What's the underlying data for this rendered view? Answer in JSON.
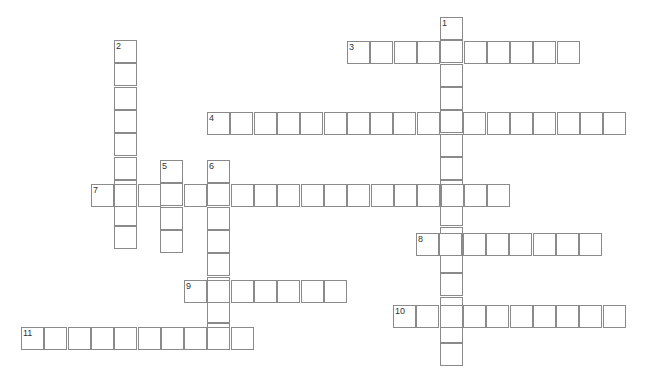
{
  "puzzle": {
    "type": "crossword",
    "cell_size": 23.3,
    "words": [
      {
        "number": "1",
        "direction": "down",
        "x": 440,
        "y": 17,
        "length": 15
      },
      {
        "number": "2",
        "direction": "down",
        "x": 114,
        "y": 40,
        "length": 9
      },
      {
        "number": "3",
        "direction": "across",
        "x": 347,
        "y": 41,
        "length": 10
      },
      {
        "number": "4",
        "direction": "across",
        "x": 207,
        "y": 112,
        "length": 18
      },
      {
        "number": "5",
        "direction": "down",
        "x": 160,
        "y": 160,
        "length": 4
      },
      {
        "number": "6",
        "direction": "down",
        "x": 207,
        "y": 160,
        "length": 8
      },
      {
        "number": "7",
        "direction": "across",
        "x": 91,
        "y": 184,
        "length": 18
      },
      {
        "number": "8",
        "direction": "across",
        "x": 416,
        "y": 233,
        "length": 8
      },
      {
        "number": "9",
        "direction": "across",
        "x": 184,
        "y": 280,
        "length": 7
      },
      {
        "number": "10",
        "direction": "across",
        "x": 393,
        "y": 305,
        "length": 10
      },
      {
        "number": "11",
        "direction": "across",
        "x": 21,
        "y": 327,
        "length": 10
      }
    ]
  }
}
